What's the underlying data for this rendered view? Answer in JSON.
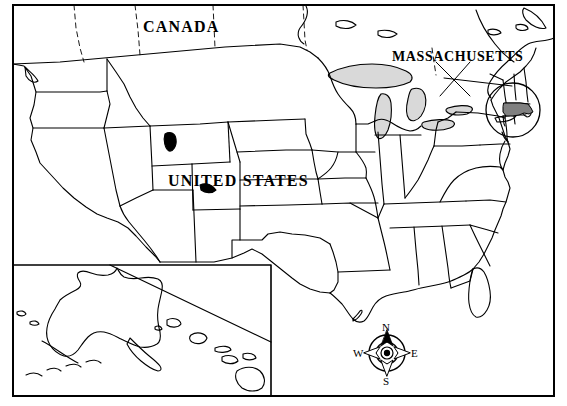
{
  "map": {
    "title": "United States Map with Massachusetts Highlighted",
    "style": "outline political map, black line art on white",
    "labels": {
      "canada": "CANADA",
      "united_states": "UNITED STATES",
      "massachusetts": "MASSACHUSETTS"
    },
    "compass": {
      "name": "compass-rose",
      "north": "N",
      "south": "S",
      "east": "E",
      "west": "W"
    },
    "colors": {
      "background": "#ffffff",
      "outline": "#000000",
      "highlight_fill": "#808080",
      "lake_fill": "#d9d9d9",
      "frame": "#000000"
    },
    "highlighted_state": "MASSACHUSETTS",
    "insets": [
      {
        "name": "alaska-hawaii-inset",
        "contents": "Alaska and Hawaii"
      }
    ]
  }
}
